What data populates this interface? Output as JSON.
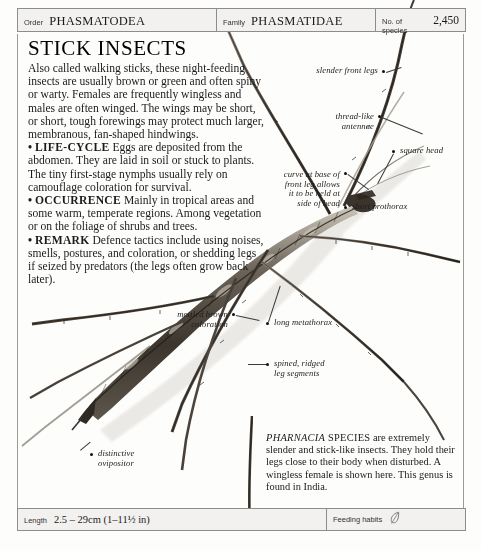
{
  "header": {
    "fields": [
      {
        "key": "Order",
        "value": "PHASMATODEA"
      },
      {
        "key": "Family",
        "value": "PHASMATIDAE"
      },
      {
        "key": "No. of species",
        "value": "2,450"
      }
    ]
  },
  "title": "STICK INSECTS",
  "body": {
    "intro": "Also called walking sticks, these night-feeding insects are usually brown or green and often spiny or warty. Females are frequently wingless and males are often winged. The wings may be short, or short, tough forewings may protect much larger, membranous, fan-shaped hindwings.",
    "sections": [
      {
        "bullet": "•",
        "heading": "LIFE-CYCLE",
        "text": " Eggs are deposited from the abdomen. They are laid in soil or stuck to plants. The tiny first-stage nymphs usually rely on camouflage coloration for survival."
      },
      {
        "bullet": "•",
        "heading": "OCCURRENCE",
        "text": " Mainly in tropical areas and some warm, temperate regions. Among vegetation or on the foliage of shrubs and trees."
      },
      {
        "bullet": "•",
        "heading": "REMARK",
        "text": " Defence tactics include using noises, smells, postures, and coloration, or shedding legs if seized by predators (the legs often grow back later)."
      }
    ]
  },
  "annotations": [
    {
      "id": "slender-front-legs",
      "text": "slender front legs"
    },
    {
      "id": "thread-like-antennae",
      "text": "thread-like\nantennae"
    },
    {
      "id": "square-head",
      "text": "square head"
    },
    {
      "id": "curve-at-base",
      "text": "curve at base of\nfront leg allows\nit to be held at\nside of head"
    },
    {
      "id": "short-prothorax",
      "text": "short prothorax"
    },
    {
      "id": "mottled-brown",
      "text": "mottled brown\ncoloration"
    },
    {
      "id": "long-metathorax",
      "text": "long metathorax"
    },
    {
      "id": "spined-ridged",
      "text": "spined, ridged\nleg segments"
    },
    {
      "id": "distinctive-ovipositor",
      "text": "distinctive\novipositor"
    }
  ],
  "caption": {
    "genus": "PHARNACIA",
    "species_word": "SPECIES",
    "text": " are extremely slender and stick-like insects. They hold their legs close to their body when disturbed. A wingless female is shown here. This genus is found in India."
  },
  "footer": {
    "length_key": "Length",
    "length_value": "2.5 – 29cm (1–11½ in)",
    "feeding_key": "Feeding habits",
    "feeding_icon": "leaf-feather-icon"
  },
  "colors": {
    "rule": "#8d8d8d",
    "bar_fill": "#f2f1ef",
    "text": "#1b1b1b",
    "insect_dark": "#35302b",
    "insect_mid": "#7a7068",
    "insect_light": "#b8b1a7"
  }
}
